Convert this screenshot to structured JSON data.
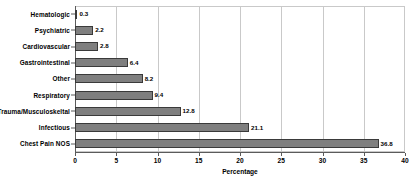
{
  "chart_data": {
    "type": "bar",
    "orientation": "horizontal",
    "title": "",
    "xlabel": "Percentage",
    "ylabel": "",
    "categories": [
      "Hematologic",
      "Psychiatric",
      "Cardiovascular",
      "Gastrointestinal",
      "Other",
      "Respiratory",
      "Trauma/Musculoskeltal",
      "Infectious",
      "Chest Pain NOS"
    ],
    "values": [
      0.3,
      2.2,
      2.8,
      6.4,
      8.2,
      9.4,
      12.8,
      21.1,
      36.8
    ],
    "value_labels": [
      "0.3",
      "2.2",
      "2.8",
      "6.4",
      "8.2",
      "9.4",
      "12.8",
      "21.1",
      "36.8"
    ],
    "xlim": [
      0,
      40
    ],
    "xticks": [
      0,
      5,
      10,
      15,
      20,
      25,
      30,
      35,
      40
    ],
    "xtick_labels": [
      "0",
      "5",
      "10",
      "15",
      "20",
      "25",
      "30",
      "35",
      "40"
    ],
    "grid": true,
    "grid_axis": "x",
    "legend": false,
    "bar_color": "#7f7f7f",
    "bar_edge_color": "#3a3a3a",
    "grid_color": "#c9c9c9",
    "axis_color": "#5b5b5b",
    "background_color": "#ffffff"
  }
}
